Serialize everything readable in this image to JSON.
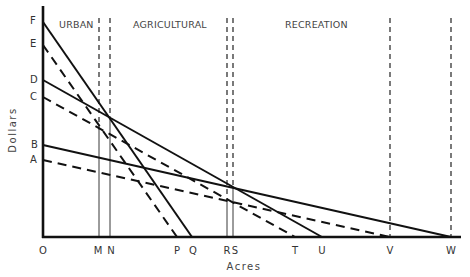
{
  "diagram": {
    "y_axis_label": "Dollars",
    "x_axis_label": "Acres",
    "zones": [
      {
        "label": "URBAN"
      },
      {
        "label": "AGRICULTURAL"
      },
      {
        "label": "RECREATION"
      }
    ],
    "y_points": [
      {
        "label": "F"
      },
      {
        "label": "E"
      },
      {
        "label": "D"
      },
      {
        "label": "C"
      },
      {
        "label": "B"
      },
      {
        "label": "A"
      }
    ],
    "x_points": [
      {
        "label": "O"
      },
      {
        "label": "M"
      },
      {
        "label": "N"
      },
      {
        "label": "P"
      },
      {
        "label": "Q"
      },
      {
        "label": "R"
      },
      {
        "label": "S"
      },
      {
        "label": "T"
      },
      {
        "label": "U"
      },
      {
        "label": "V"
      },
      {
        "label": "W"
      }
    ],
    "lines": [
      {
        "from": "F",
        "to": "Q",
        "style": "solid"
      },
      {
        "from": "E",
        "to": "P",
        "style": "dashed"
      },
      {
        "from": "D",
        "to": "U",
        "style": "solid"
      },
      {
        "from": "C",
        "to": "T",
        "style": "dashed"
      },
      {
        "from": "B",
        "to": "W",
        "style": "solid"
      },
      {
        "from": "A",
        "to": "V",
        "style": "dashed"
      }
    ]
  }
}
